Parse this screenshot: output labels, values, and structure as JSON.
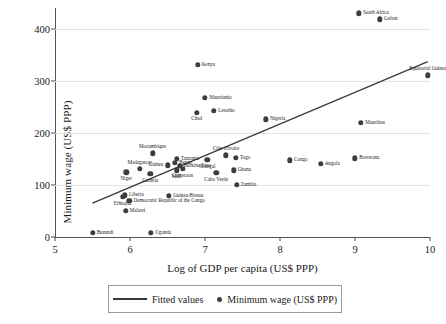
{
  "chart_data": {
    "type": "scatter",
    "title": "",
    "xlabel": "Log of GDP per capita (US$ PPP)",
    "ylabel": "Minimum wage (US$ PPP)",
    "xlim": [
      5,
      10
    ],
    "ylim": [
      0,
      440
    ],
    "xticks": [
      5,
      6,
      7,
      8,
      9,
      10
    ],
    "yticks": [
      0,
      100,
      200,
      300,
      400
    ],
    "grid": "horizontal",
    "legend_position": "below-plot",
    "legend": [
      {
        "label": "Fitted values",
        "marker": "line"
      },
      {
        "label": "Minimum wage (US$ PPP)",
        "marker": "dot"
      }
    ],
    "series": [
      {
        "name": "Minimum wage (US$ PPP)",
        "marker": "dot",
        "color": "#3d3d3d",
        "points": [
          {
            "label": "South Africa",
            "x": 9.05,
            "y": 430,
            "anchor": "right"
          },
          {
            "label": "Gabon",
            "x": 9.33,
            "y": 418,
            "anchor": "right"
          },
          {
            "label": "Equatorial Guinea",
            "x": 9.97,
            "y": 311,
            "anchor": "above"
          },
          {
            "label": "Kenya",
            "x": 6.9,
            "y": 331,
            "anchor": "right"
          },
          {
            "label": "Mauritania",
            "x": 7.0,
            "y": 267,
            "anchor": "right"
          },
          {
            "label": "Lesotho",
            "x": 7.12,
            "y": 242,
            "anchor": "right"
          },
          {
            "label": "Chad",
            "x": 6.89,
            "y": 239,
            "anchor": "below"
          },
          {
            "label": "Nigeria",
            "x": 7.81,
            "y": 226,
            "anchor": "right"
          },
          {
            "label": "Mauritius",
            "x": 9.08,
            "y": 220,
            "anchor": "right"
          },
          {
            "label": "Mozambique",
            "x": 6.3,
            "y": 161,
            "anchor": "above"
          },
          {
            "label": "Côte d'Ivoire",
            "x": 7.28,
            "y": 157,
            "anchor": "above"
          },
          {
            "label": "Togo",
            "x": 7.41,
            "y": 152,
            "anchor": "right"
          },
          {
            "label": "Botswana",
            "x": 9.0,
            "y": 151,
            "anchor": "right"
          },
          {
            "label": "Congo",
            "x": 8.13,
            "y": 147,
            "anchor": "right"
          },
          {
            "label": "Angola",
            "x": 8.54,
            "y": 141,
            "anchor": "right"
          },
          {
            "label": "Tanzania",
            "x": 6.62,
            "y": 150,
            "anchor": "right"
          },
          {
            "label": "Senegal",
            "x": 7.03,
            "y": 148,
            "anchor": "below"
          },
          {
            "label": "Benin",
            "x": 6.6,
            "y": 142,
            "anchor": "right"
          },
          {
            "label": "Burkina Faso",
            "x": 6.66,
            "y": 137,
            "anchor": "right"
          },
          {
            "label": "Guinea",
            "x": 6.5,
            "y": 138,
            "anchor": "left"
          },
          {
            "label": "Cameroon",
            "x": 6.7,
            "y": 131,
            "anchor": "below"
          },
          {
            "label": "Madagascar",
            "x": 6.13,
            "y": 131,
            "anchor": "above"
          },
          {
            "label": "Ghana",
            "x": 7.38,
            "y": 128,
            "anchor": "right"
          },
          {
            "label": "Mali",
            "x": 6.62,
            "y": 128,
            "anchor": "below"
          },
          {
            "label": "Niger",
            "x": 5.95,
            "y": 124,
            "anchor": "below"
          },
          {
            "label": "Cabo Verde",
            "x": 7.15,
            "y": 123,
            "anchor": "below"
          },
          {
            "label": "Gambia",
            "x": 6.27,
            "y": 121,
            "anchor": "below"
          },
          {
            "label": "Zambia",
            "x": 7.42,
            "y": 100,
            "anchor": "right"
          },
          {
            "label": "Liberia",
            "x": 5.93,
            "y": 80,
            "anchor": "right"
          },
          {
            "label": "Guinea-Bissau",
            "x": 6.52,
            "y": 79,
            "anchor": "right"
          },
          {
            "label": "Ethiopia",
            "x": 5.9,
            "y": 77,
            "anchor": "below"
          },
          {
            "label": "Democratic Republic of the Congo",
            "x": 5.99,
            "y": 69,
            "anchor": "right"
          },
          {
            "label": "Malawi",
            "x": 5.94,
            "y": 50,
            "anchor": "right"
          },
          {
            "label": "Burundi",
            "x": 5.5,
            "y": 8,
            "anchor": "right"
          },
          {
            "label": "Uganda",
            "x": 6.28,
            "y": 8,
            "anchor": "right"
          }
        ]
      }
    ],
    "fitted_line": {
      "name": "Fitted values",
      "color": "#3a3a3a",
      "x_start": 5.5,
      "y_start": 65,
      "x_end": 9.97,
      "y_end": 337
    }
  }
}
